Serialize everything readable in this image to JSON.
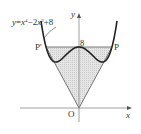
{
  "figure": {
    "curve_label": "y=x⁴−2x²+8",
    "curve_label_parts": {
      "y": "y",
      "eq": "=",
      "x1": "x",
      "exp1": "4",
      "minus": "−2",
      "x2": "x",
      "exp2": "2",
      "plus": "+8"
    },
    "axis_x_label": "x",
    "axis_y_label": "y",
    "origin_label": "O",
    "y_intercept_label": "8",
    "point_right_label": "P",
    "point_left_label": "P'",
    "shaded_color": "#dcdcdc",
    "curve_color": "#222222",
    "axis_color": "#888888"
  },
  "chart_data": {
    "type": "line",
    "title": "",
    "function": "y = x^4 - 2x^2 + 8",
    "xlabel": "x",
    "ylabel": "y",
    "annotations": [
      "O",
      "8",
      "P",
      "P'"
    ],
    "points": {
      "O": [
        0,
        0
      ],
      "P": [
        1.414,
        8
      ],
      "P_prime": [
        -1.414,
        8
      ]
    },
    "local_minima": [
      [
        -1,
        7
      ],
      [
        1,
        7
      ]
    ],
    "local_max": [
      0,
      8
    ],
    "shaded_region": "triangle O-P'-P including area between line y=8 and curve"
  }
}
